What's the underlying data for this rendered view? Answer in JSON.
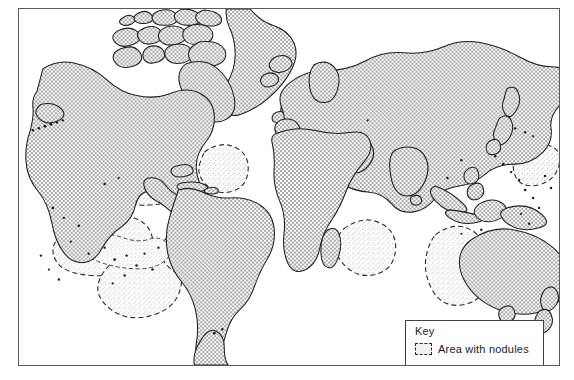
{
  "figure": {
    "type": "map",
    "projection": "cylindrical world map"
  },
  "key": {
    "title": "Key",
    "swatch_name": "dashed-area-swatch",
    "entries": [
      {
        "label": "Area with nodules",
        "pattern": "dashed outline, light stipple fill",
        "fill_color": "#f1f1f1",
        "outline_color": "#2a2a2a"
      }
    ]
  },
  "colors": {
    "land_fill": "#cfcfcf",
    "land_outline": "#1e1e1e",
    "nodule_fill": "#eeeeee",
    "nodule_outline": "#2a2a2a",
    "frame": "#555c60",
    "background": "#ffffff",
    "text": "#1c1c1c"
  },
  "landmasses": [
    "North America",
    "Greenland",
    "Canadian Arctic Archipelago",
    "South America",
    "Europe",
    "Africa",
    "Madagascar",
    "Asia",
    "Japan",
    "Indonesia",
    "New Guinea",
    "Australia",
    "New Zealand",
    "Antarctic Peninsula",
    "British Isles",
    "Iceland",
    "Caribbean islands",
    "Philippines",
    "Sri Lanka"
  ],
  "nodule_areas": [
    "North-east Pacific off California",
    "Central North Pacific",
    "Clarion-Clipperton equatorial Pacific",
    "South-central Pacific",
    "South-east Pacific off Peru",
    "North Atlantic (Sargasso region)",
    "South Atlantic off south-west Africa",
    "Central Indian Ocean basin",
    "Eastern Indian Ocean west of Australia",
    "Western Pacific near map edge"
  ]
}
